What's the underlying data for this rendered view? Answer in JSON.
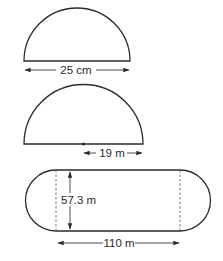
{
  "figures": [
    {
      "id": "semicircle-diameter",
      "shape": "semicircle",
      "dimension": "diameter",
      "label": "25 cm"
    },
    {
      "id": "semicircle-radius",
      "shape": "semicircle",
      "dimension": "radius",
      "label": "19 m"
    },
    {
      "id": "running-track",
      "shape": "rectangle with semicircular ends",
      "width_label": "57.3 m",
      "length_label": "110 m"
    }
  ],
  "colors": {
    "stroke": "#2b2b2b",
    "background": "#ffffff"
  }
}
